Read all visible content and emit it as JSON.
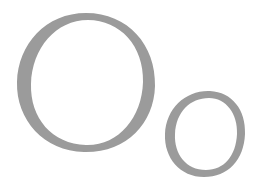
{
  "figure": {
    "background": "#ffffff",
    "ring_color": "#9b9b9b",
    "shapes": [
      {
        "name": "large-ring",
        "description": "Large calligraphic letter O"
      },
      {
        "name": "small-ring",
        "description": "Small calligraphic letter o"
      }
    ]
  }
}
